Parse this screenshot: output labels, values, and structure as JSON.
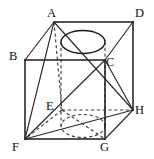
{
  "figure": {
    "canvas": {
      "width": 154,
      "height": 159
    },
    "colors": {
      "background": "#ffffff",
      "stroke_solid": "#1a1a1a",
      "stroke_hidden": "#3a3a3a",
      "label": "#111111"
    },
    "vertices": [
      {
        "name": "A",
        "label": "A",
        "point": {
          "x": 54,
          "y": 22
        },
        "label_pos": {
          "x": 47,
          "y": 10
        },
        "hidden": false
      },
      {
        "name": "B",
        "label": "B",
        "point": {
          "x": 25,
          "y": 60
        },
        "label_pos": {
          "x": 9,
          "y": 52
        },
        "hidden": false
      },
      {
        "name": "C",
        "label": "C",
        "point": {
          "x": 105,
          "y": 60
        },
        "label_pos": {
          "x": 106,
          "y": 57
        },
        "hidden": false
      },
      {
        "name": "D",
        "label": "D",
        "point": {
          "x": 133,
          "y": 22
        },
        "label_pos": {
          "x": 136,
          "y": 10
        },
        "hidden": false
      },
      {
        "name": "E",
        "label": "E",
        "point": {
          "x": 62,
          "y": 110
        },
        "label_pos": {
          "x": 46,
          "y": 101
        },
        "hidden": true
      },
      {
        "name": "F",
        "label": "F",
        "point": {
          "x": 25,
          "y": 139
        },
        "label_pos": {
          "x": 12,
          "y": 141
        },
        "hidden": false
      },
      {
        "name": "G",
        "label": "G",
        "point": {
          "x": 105,
          "y": 139
        },
        "label_pos": {
          "x": 101,
          "y": 141
        },
        "hidden": false
      },
      {
        "name": "H",
        "label": "H",
        "point": {
          "x": 133,
          "y": 110
        },
        "label_pos": {
          "x": 136,
          "y": 107
        },
        "hidden": false
      }
    ],
    "edges": [
      {
        "name": "edge-A-D",
        "from": "A",
        "to": "D",
        "style": "solid"
      },
      {
        "name": "edge-A-B",
        "from": "A",
        "to": "B",
        "style": "solid"
      },
      {
        "name": "edge-B-C",
        "from": "B",
        "to": "C",
        "style": "solid"
      },
      {
        "name": "edge-C-D",
        "from": "C",
        "to": "D",
        "style": "solid"
      },
      {
        "name": "edge-B-F",
        "from": "B",
        "to": "F",
        "style": "solid"
      },
      {
        "name": "edge-C-G",
        "from": "C",
        "to": "G",
        "style": "solid"
      },
      {
        "name": "edge-D-H",
        "from": "D",
        "to": "H",
        "style": "solid"
      },
      {
        "name": "edge-F-G",
        "from": "F",
        "to": "G",
        "style": "solid"
      },
      {
        "name": "edge-G-H",
        "from": "G",
        "to": "H",
        "style": "solid"
      },
      {
        "name": "edge-A-E",
        "from": "A",
        "to": "E",
        "style": "hidden"
      },
      {
        "name": "edge-E-F",
        "from": "E",
        "to": "F",
        "style": "hidden"
      },
      {
        "name": "edge-E-G",
        "from": "E",
        "to": "G",
        "style": "hidden"
      },
      {
        "name": "edge-E-H",
        "from": "E",
        "to": "H",
        "style": "hidden"
      }
    ],
    "diagonals": [
      {
        "name": "diagonal-A-F",
        "from": "A",
        "to": "F",
        "style": "solid"
      },
      {
        "name": "diagonal-A-H",
        "from": "A",
        "to": "H",
        "style": "solid"
      },
      {
        "name": "diagonal-C-F",
        "from": "C",
        "to": "F",
        "style": "solid"
      },
      {
        "name": "diagonal-F-H",
        "from": "F",
        "to": "H",
        "style": "solid"
      },
      {
        "name": "diagonal-B-F-upper",
        "from": "A",
        "to": "B",
        "style": "solid"
      }
    ],
    "cylinder": {
      "name": "inscribed-cylinder",
      "top_ellipse": {
        "cx": 83,
        "cy": 42,
        "rx": 22,
        "ry": 11.5,
        "style": "solid"
      },
      "bottom_ellipse": {
        "cx": 83,
        "cy": 126,
        "rx": 22,
        "ry": 11.5,
        "style": "hidden"
      },
      "left_wall": {
        "x": 61,
        "y1": 42,
        "y2": 126,
        "style": "hidden"
      },
      "right_wall": {
        "x": 105,
        "y1": 42,
        "y2": 126,
        "style": "hidden"
      }
    }
  }
}
